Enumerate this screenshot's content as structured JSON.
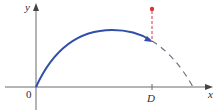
{
  "diagram": {
    "axes": {
      "x_label": "x",
      "y_label": "y",
      "origin_label": "0"
    },
    "marks": {
      "d_label": "D"
    },
    "colors": {
      "curve": "#2f4fa8",
      "dashed_continuation": "#6a6a7a",
      "marker": "#d8343c",
      "axis": "#555555"
    },
    "elements": [
      "solid projectile trajectory curve from origin",
      "dashed continuation of trajectory to x-axis",
      "red dashed vertical segment above D ending in red dot",
      "tick mark at D on x-axis"
    ]
  }
}
